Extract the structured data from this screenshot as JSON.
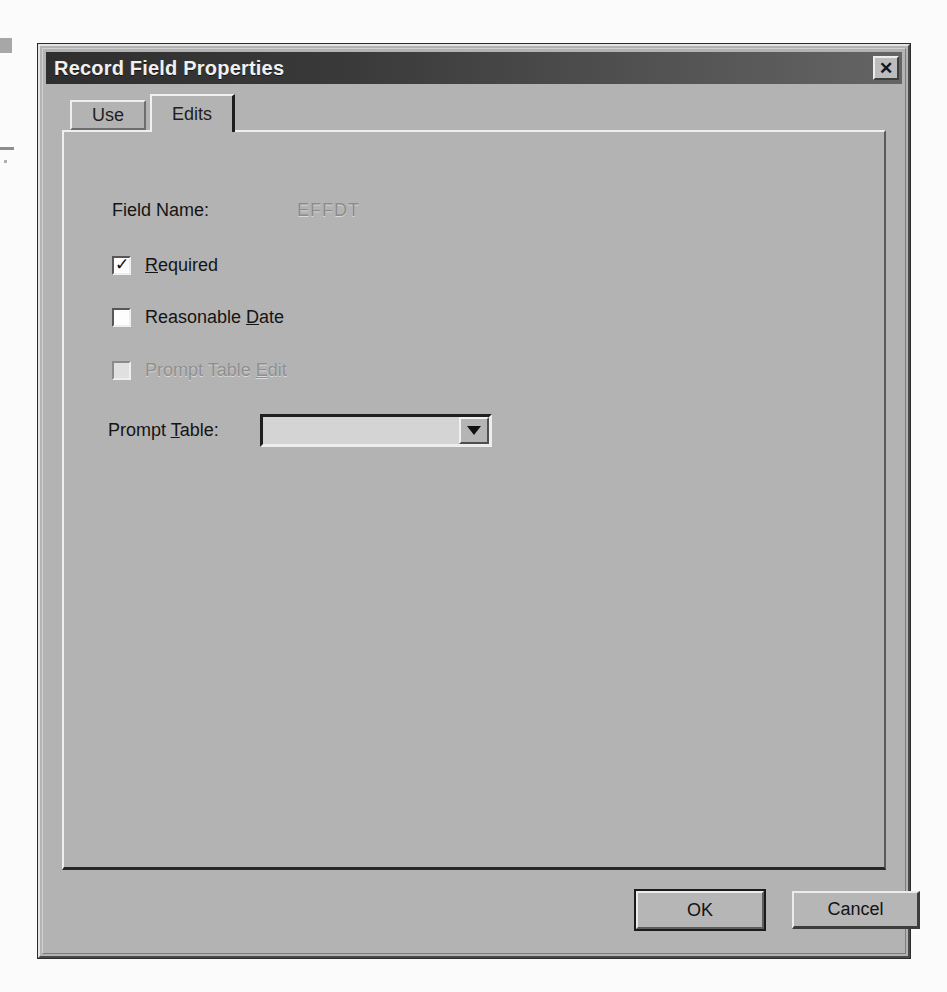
{
  "window": {
    "title": "Record Field Properties",
    "close_icon": "close-icon",
    "close_glyph": "✕"
  },
  "tabs": [
    {
      "label": "Use",
      "active": false
    },
    {
      "label": "Edits",
      "active": true
    }
  ],
  "form": {
    "field_name_label": "Field Name:",
    "field_name_value": "EFFDT",
    "checkboxes": [
      {
        "label_prefix": "",
        "accel": "R",
        "label_suffix": "equired",
        "checked": true,
        "checked_glyph": "✓",
        "enabled": true
      },
      {
        "label_prefix": "Reasonable ",
        "accel": "D",
        "label_suffix": "ate",
        "checked": false,
        "checked_glyph": "",
        "enabled": true
      },
      {
        "label_prefix": "Prompt Table ",
        "accel": "E",
        "label_suffix": "dit",
        "checked": false,
        "checked_glyph": "",
        "enabled": false
      }
    ],
    "prompt_table": {
      "label_prefix": "Prompt ",
      "accel": "T",
      "label_suffix": "able:",
      "value": "",
      "enabled": false,
      "arrow_icon": "chevron-down-icon"
    }
  },
  "buttons": {
    "ok_label": "OK",
    "cancel_label": "Cancel"
  },
  "colors": {
    "dialog_face": "#b4b4b4",
    "titlebar_start": "#2f2f2f",
    "titlebar_end": "#656565",
    "title_text": "#f2f2f2",
    "disabled_text": "#8e8e8e"
  }
}
